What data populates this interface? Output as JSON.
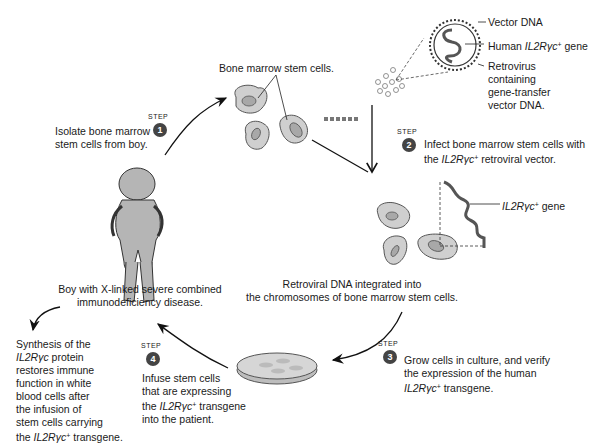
{
  "figure": {
    "labels": {
      "bone_marrow_cells": "Bone marrow stem cells.",
      "vector_dna": "Vector DNA",
      "human_gene_prefix": "Human ",
      "human_gene_name": "IL2Rγc",
      "human_gene_suffix": " gene",
      "retrovirus_lines": [
        "Retrovirus",
        "containing",
        "gene-transfer",
        "vector DNA."
      ],
      "integrated_gene_name": "IL2Rγc",
      "integrated_gene_suffix": " gene",
      "retroviral_integrated_lines": [
        "Retroviral DNA integrated into",
        "the chromosomes of bone marrow stem cells."
      ],
      "boy_lines": [
        "Boy with X-linked severe combined",
        "immunodeficiency disease."
      ],
      "superscript_plus": "+"
    },
    "step_word": "STEP",
    "steps": [
      {
        "number": "1",
        "lines": [
          "Isolate bone marrow",
          "stem cells from boy."
        ]
      },
      {
        "number": "2",
        "line1": "Infect bone marrow stem cells with",
        "line2_prefix": "the ",
        "gene": "IL2Rγc",
        "line2_suffix": " retroviral vector."
      },
      {
        "number": "3",
        "line1": "Grow cells in culture, and verify",
        "line2": "the expression of the human",
        "gene": "IL2Rγc",
        "line3_suffix": " transgene."
      },
      {
        "number": "4",
        "line1": "Infuse stem cells",
        "line2": "that are expressing",
        "line3_prefix": "the ",
        "gene": "IL2Rγc",
        "line3_suffix": " transgene",
        "line4": "into the patient."
      }
    ],
    "outcome": {
      "line1": "Synthesis of the",
      "gene": "IL2Rγc",
      "line2_suffix": " protein",
      "line3": "restores immune",
      "line4": "function in white",
      "line5": "blood cells after",
      "line6": "the infusion of",
      "line7": "stem cells carrying",
      "line8_prefix": "the ",
      "line8_suffix": " transgene."
    },
    "colors": {
      "cell_fill": "#cfcfcf",
      "nucleus_fill": "#a8a8a8",
      "stroke": "#333333",
      "step_badge": "#444444"
    }
  }
}
